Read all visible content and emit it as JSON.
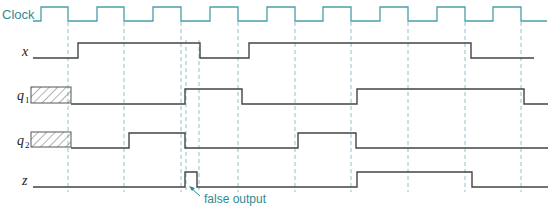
{
  "diagram": {
    "type": "timing-diagram",
    "colors": {
      "clock": "#4a9ea6",
      "signal": "#444444",
      "dashed": "#8fc3c8",
      "annotation": "#2f8a93",
      "hatch": "#555555"
    },
    "signals": [
      {
        "id": "clock",
        "label": "Clock",
        "subscript": "",
        "initial": 0,
        "transitions": [
          41,
          68,
          97,
          124,
          153,
          181,
          210,
          238,
          267,
          295,
          323,
          351,
          380,
          408,
          437,
          465,
          493,
          521
        ],
        "start": 33,
        "end": 547,
        "unknown_until": null
      },
      {
        "id": "x",
        "label": "x",
        "subscript": "",
        "initial": 0,
        "transitions": [
          78,
          200,
          249,
          471
        ],
        "start": 33,
        "end": 534,
        "unknown_until": null
      },
      {
        "id": "q1",
        "label": "q",
        "subscript": "1",
        "initial": 0,
        "transitions": [
          185,
          242,
          357,
          524
        ],
        "start": 71,
        "end": 548,
        "unknown_until": 71
      },
      {
        "id": "q2",
        "label": "q",
        "subscript": "2",
        "initial": 0,
        "transitions": [
          129,
          185,
          298,
          356
        ],
        "start": 71,
        "end": 548,
        "unknown_until": 71
      },
      {
        "id": "z",
        "label": "z",
        "subscript": "",
        "initial": 0,
        "transitions": [
          185,
          197,
          357,
          472
        ],
        "start": 33,
        "end": 548,
        "unknown_until": null
      }
    ],
    "clock_edges_dashed": [
      68,
      124,
      181,
      238,
      295,
      351,
      408,
      465,
      521
    ],
    "extra_dashed": [
      186,
      199
    ],
    "annotation": {
      "text": "false output"
    }
  }
}
